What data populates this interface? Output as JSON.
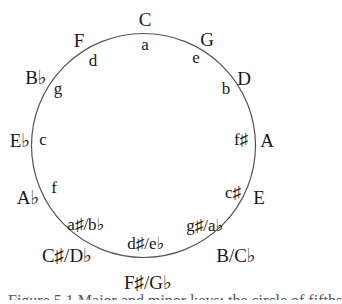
{
  "diagram": {
    "type": "circle-of-fifths",
    "circle": {
      "cx": 143.5,
      "cy": 145.5,
      "r": 112,
      "stroke": "#555555"
    },
    "major_keys": [
      {
        "label": "C",
        "x": 145,
        "y": 19
      },
      {
        "label": "G",
        "x": 207,
        "y": 39
      },
      {
        "label": "D",
        "x": 244,
        "y": 78
      },
      {
        "label": "A",
        "x": 267,
        "y": 140
      },
      {
        "label": "E",
        "x": 259,
        "y": 197
      },
      {
        "label": "B/C♭",
        "x": 236,
        "y": 255
      },
      {
        "label": "F♯/G♭",
        "x": 148,
        "y": 282
      },
      {
        "label": "C♯/D♭",
        "x": 67,
        "y": 255
      },
      {
        "label": "A♭",
        "x": 28,
        "y": 197
      },
      {
        "label": "E♭",
        "x": 20,
        "y": 140
      },
      {
        "label": "B♭",
        "x": 36,
        "y": 77
      },
      {
        "label": "F",
        "x": 79,
        "y": 40
      }
    ],
    "minor_keys": [
      {
        "label": "a",
        "x": 145,
        "y": 44
      },
      {
        "label": "e",
        "x": 196,
        "y": 57
      },
      {
        "label": "b",
        "x": 226,
        "y": 88
      },
      {
        "label": "f♯",
        "x": 241,
        "y": 139
      },
      {
        "label": "c♯",
        "x": 233,
        "y": 192
      },
      {
        "label": "g♯/a♭",
        "x": 205,
        "y": 225
      },
      {
        "label": "d♯/e♭",
        "x": 146,
        "y": 243
      },
      {
        "label": "a♯/b♭",
        "x": 86,
        "y": 224
      },
      {
        "label": "f",
        "x": 54,
        "y": 187
      },
      {
        "label": "c",
        "x": 43,
        "y": 139
      },
      {
        "label": "g",
        "x": 58,
        "y": 88
      },
      {
        "label": "d",
        "x": 93,
        "y": 60
      }
    ]
  },
  "caption": "Figure 5.1 Major and minor keys: the circle of fifths"
}
